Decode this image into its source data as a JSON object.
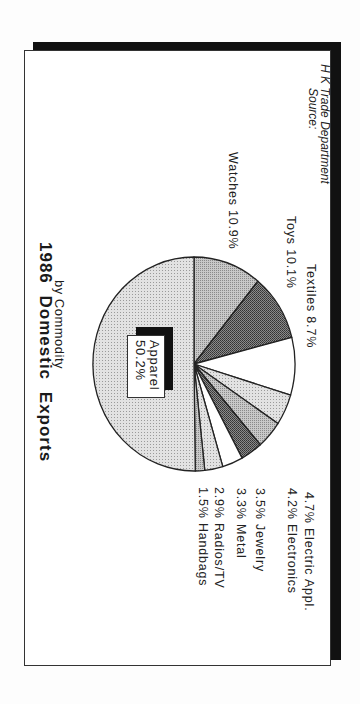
{
  "chart_data": {
    "type": "pie",
    "title": "1986 Domestic Exports",
    "subtitle": "by Commodity",
    "orientation": "rotated 90deg clockwise",
    "unit": "%",
    "slices": [
      {
        "label": "Apparel",
        "value": 50.2,
        "text": "50.2%",
        "fill": "light-dots"
      },
      {
        "label": "Watches",
        "value": 10.9,
        "text": "10.9%",
        "fill": "medium-gray"
      },
      {
        "label": "Toys",
        "value": 10.1,
        "text": "10.1%",
        "fill": "dark-crosshatch"
      },
      {
        "label": "Textiles",
        "value": 8.7,
        "text": "8.7%",
        "fill": "white"
      },
      {
        "label": "Electric Appl.",
        "value": 4.7,
        "text": "4.7%",
        "fill": "light-gray"
      },
      {
        "label": "Electronics",
        "value": 4.2,
        "text": "4.2%",
        "fill": "medium-gray"
      },
      {
        "label": "Jewelry",
        "value": 3.5,
        "text": "3.5%",
        "fill": "dark-crosshatch"
      },
      {
        "label": "Metal",
        "value": 3.3,
        "text": "3.3%",
        "fill": "white"
      },
      {
        "label": "Radios/TV",
        "value": 2.9,
        "text": "2.9%",
        "fill": "light-gray"
      },
      {
        "label": "Handbags",
        "value": 1.5,
        "text": "1.5%",
        "fill": "medium-gray"
      }
    ],
    "source": "Source: H K Trade Department"
  },
  "title": {
    "line1": "1986  Domestic  Exports",
    "line2": "by Commodity"
  },
  "labels": {
    "apparel_name": "Apparel",
    "apparel_value": "50.2%",
    "watches": "Watches 10.9%",
    "toys": "Toys  10.1%",
    "textiles": "Textiles  8.7%",
    "electric": "4.7%  Electric Appl.",
    "electronics": "4.2%  Electronics",
    "jewelry": "3.5%  Jewelry",
    "metal": "3.3%  Metal",
    "radios": "2.9%  Radios/TV",
    "handbags": "1.5%  Handbags"
  },
  "source": {
    "line1": "Source:",
    "line2": "H K Trade Department"
  },
  "colors": {
    "frame": "#333333",
    "shadow": "#111111",
    "light": "#d8d8d8",
    "medium": "#b4b4b4",
    "dark": "#6a6a6a"
  }
}
